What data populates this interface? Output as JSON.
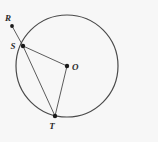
{
  "figure": {
    "background_color": "#f7f7f7",
    "stroke_color": "#4a4a4a",
    "point_color": "#1a1a1a",
    "label_color": "#2b2b2b",
    "circle": {
      "label": "circle-O",
      "cx": 67,
      "cy": 66,
      "r": 51,
      "stroke_width": 1.2
    },
    "points": [
      {
        "id": "R",
        "label": "R",
        "x": 12,
        "y": 26,
        "label_x": 5,
        "label_y": 21,
        "on_circle": false,
        "dot_r": 1.9
      },
      {
        "id": "S",
        "label": "S",
        "x": 23,
        "y": 46,
        "label_x": 13,
        "label_y": 49,
        "on_circle": true,
        "dot_r": 2.2
      },
      {
        "id": "O",
        "label": "O",
        "x": 67,
        "y": 66,
        "label_x": 72,
        "label_y": 70,
        "on_circle": false,
        "dot_r": 2.2
      },
      {
        "id": "T",
        "label": "T",
        "x": 55,
        "y": 116,
        "label_x": 52,
        "label_y": 129,
        "on_circle": true,
        "dot_r": 2.2
      }
    ],
    "segments": [
      {
        "id": "RS",
        "label": "segment-R-S",
        "x1": 12,
        "y1": 26,
        "x2": 23,
        "y2": 46,
        "stroke_width": 0.9
      },
      {
        "id": "SO",
        "label": "segment-S-O",
        "x1": 23,
        "y1": 46,
        "x2": 67,
        "y2": 66,
        "stroke_width": 0.9
      },
      {
        "id": "ST",
        "label": "segment-S-T",
        "x1": 23,
        "y1": 46,
        "x2": 55,
        "y2": 116,
        "stroke_width": 0.9
      },
      {
        "id": "OT",
        "label": "segment-O-T",
        "x1": 67,
        "y1": 66,
        "x2": 55,
        "y2": 116,
        "stroke_width": 0.9
      }
    ]
  }
}
